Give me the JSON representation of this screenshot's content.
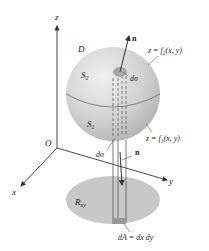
{
  "figure": {
    "axes": {
      "z": "z",
      "x": "x",
      "y": "y",
      "origin": "O"
    },
    "labels": {
      "region": "D",
      "upper_surface": "S",
      "upper_surface_sub": "2",
      "lower_surface": "S",
      "lower_surface_sub": "1",
      "upper_normal": "n",
      "lower_normal": "n",
      "upper_dsigma": "dσ",
      "lower_dsigma": "dσ",
      "upper_eq_pre": "z = f",
      "upper_eq_sub": "2",
      "upper_eq_post": "(x, y)",
      "lower_eq_pre": "z = f",
      "lower_eq_sub": "1",
      "lower_eq_post": "(x, y)",
      "projection": "R",
      "projection_sub": "xy",
      "area_element": "dA = dx dy"
    },
    "colors": {
      "sphere_light": "#eeeeee",
      "sphere_dark": "#b5b5b5",
      "region_fill": "#c8c8c8",
      "line": "#333333"
    }
  }
}
